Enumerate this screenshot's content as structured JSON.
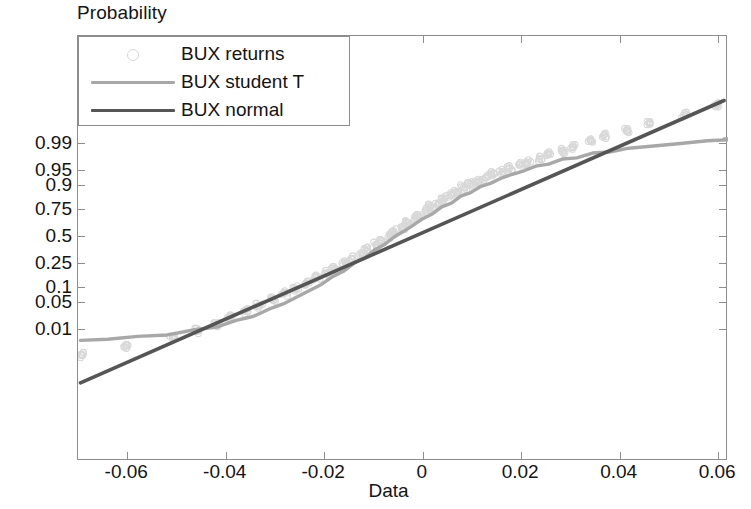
{
  "chart_data": {
    "type": "scatter",
    "title": "",
    "ylabel": "Probability",
    "xlabel": "Data",
    "xlim": [
      -0.07,
      0.062
    ],
    "xticks": [
      -0.06,
      -0.04,
      -0.02,
      0,
      0.02,
      0.04,
      0.06
    ],
    "xticklabels": [
      "-0.06",
      "-0.04",
      "-0.02",
      "0",
      "0.02",
      "0.04",
      "0.06"
    ],
    "yticks": [
      0.99,
      0.95,
      0.9,
      0.75,
      0.5,
      0.25,
      0.1,
      0.05,
      0.01
    ],
    "yticklabels": [
      "0.99",
      "0.95",
      "0.9",
      "0.75",
      "0.5",
      "0.25",
      "0.1",
      "0.05",
      "0.01"
    ],
    "yscale": "normal-probability",
    "grid": false,
    "legend_position": "upper-left",
    "series": [
      {
        "name": "BUX returns",
        "marker": "circle",
        "color": "#d8d8d8",
        "style": "points",
        "x": [
          -0.0695,
          -0.06,
          -0.051,
          -0.0455,
          -0.042,
          -0.039,
          -0.036,
          -0.0332,
          -0.0305,
          -0.028,
          -0.0258,
          -0.0236,
          -0.0215,
          -0.0196,
          -0.0178,
          -0.016,
          -0.0143,
          -0.0127,
          -0.0112,
          -0.0097,
          -0.0083,
          -0.0069,
          -0.0056,
          -0.0043,
          -0.003,
          -0.0018,
          -0.0006,
          0.0006,
          0.0018,
          0.003,
          0.0043,
          0.0056,
          0.0069,
          0.0083,
          0.0097,
          0.0112,
          0.0127,
          0.0143,
          0.016,
          0.0178,
          0.0196,
          0.0215,
          0.0236,
          0.0258,
          0.0282,
          0.0308,
          0.0338,
          0.0372,
          0.0412,
          0.0462,
          0.053,
          0.06
        ],
        "p": [
          0.0015,
          0.003,
          0.0055,
          0.009,
          0.014,
          0.021,
          0.03,
          0.042,
          0.057,
          0.075,
          0.096,
          0.12,
          0.147,
          0.177,
          0.21,
          0.246,
          0.284,
          0.324,
          0.366,
          0.409,
          0.453,
          0.497,
          0.541,
          0.584,
          0.625,
          0.664,
          0.701,
          0.735,
          0.767,
          0.796,
          0.822,
          0.846,
          0.867,
          0.886,
          0.902,
          0.916,
          0.928,
          0.938,
          0.947,
          0.955,
          0.962,
          0.968,
          0.974,
          0.979,
          0.9835,
          0.9875,
          0.991,
          0.994,
          0.996,
          0.9975,
          0.9988,
          0.9995
        ]
      },
      {
        "name": "BUX student T",
        "color": "#a8a8a8",
        "style": "line",
        "x": [
          -0.0695,
          -0.064,
          -0.058,
          -0.052,
          -0.0465,
          -0.042,
          -0.038,
          -0.0345,
          -0.0312,
          -0.0282,
          -0.0254,
          -0.0228,
          -0.0204,
          -0.0181,
          -0.0159,
          -0.0138,
          -0.0118,
          -0.0098,
          -0.0079,
          -0.006,
          -0.004,
          -0.002,
          0.0,
          0.002,
          0.004,
          0.006,
          0.0079,
          0.0098,
          0.0118,
          0.0138,
          0.0159,
          0.0181,
          0.0204,
          0.0228,
          0.0254,
          0.0282,
          0.0312,
          0.0345,
          0.038,
          0.042,
          0.0465,
          0.052,
          0.058,
          0.064,
          0.0612
        ],
        "p": [
          0.0045,
          0.005,
          0.0058,
          0.007,
          0.009,
          0.012,
          0.0165,
          0.023,
          0.0325,
          0.0455,
          0.063,
          0.086,
          0.115,
          0.152,
          0.196,
          0.246,
          0.301,
          0.361,
          0.423,
          0.486,
          0.548,
          0.608,
          0.664,
          0.715,
          0.761,
          0.801,
          0.835,
          0.864,
          0.888,
          0.908,
          0.925,
          0.9385,
          0.9495,
          0.9585,
          0.9655,
          0.9715,
          0.976,
          0.98,
          0.983,
          0.9855,
          0.9878,
          0.9895,
          0.9912,
          0.9925,
          0.992
        ]
      },
      {
        "name": "BUX normal",
        "color": "#555555",
        "style": "line",
        "x": [
          -0.0695,
          0.0612
        ],
        "p": [
          0.00012,
          0.99965
        ]
      }
    ]
  },
  "legend": {
    "entries": [
      {
        "label": "BUX returns",
        "marker": "circle",
        "color": "#d8d8d8"
      },
      {
        "label": "BUX student T",
        "marker": "line",
        "color": "#a8a8a8"
      },
      {
        "label": "BUX normal",
        "marker": "line",
        "color": "#555555"
      }
    ]
  },
  "axes": {
    "y_title": "Probability",
    "x_title": "Data",
    "axis_color": "#8d8d8d"
  }
}
